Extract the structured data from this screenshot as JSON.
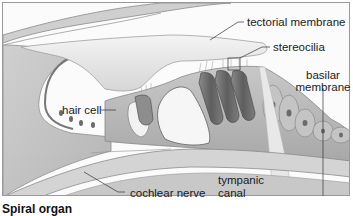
{
  "figure": {
    "caption": "Spiral organ",
    "labels": {
      "tectorial_membrane": "tectorial membrane",
      "stereocilia": "stereocilia",
      "basilar_membrane_line1": "basilar",
      "basilar_membrane_line2": "membrane",
      "hair_cell": "hair cell",
      "cochlear_nerve": "cochlear nerve",
      "tympanic_canal_line1": "tympanic",
      "tympanic_canal_line2": "canal"
    },
    "colors": {
      "tissue_light": "#e6e6e6",
      "tissue_mid": "#bdbdbd",
      "tissue_dark": "#6e6e6e",
      "cell_dark": "#555555",
      "frame": "#9a9a9a",
      "text": "#1a1a1a"
    }
  }
}
